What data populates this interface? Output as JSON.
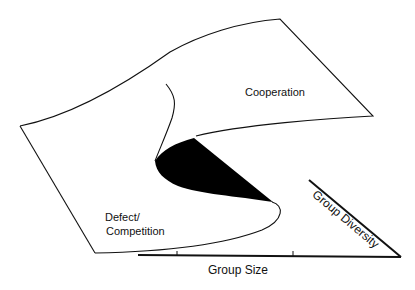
{
  "diagram": {
    "type": "cusp catastrophe surface",
    "regions": {
      "upper": "Cooperation",
      "lower_line1": "Defect/",
      "lower_line2": "Competition"
    },
    "axes": {
      "x": "Group Size",
      "diagonal": "Group Diversity"
    },
    "colors": {
      "line": "#111111",
      "fold_fill": "#000000",
      "background": "#ffffff"
    }
  }
}
